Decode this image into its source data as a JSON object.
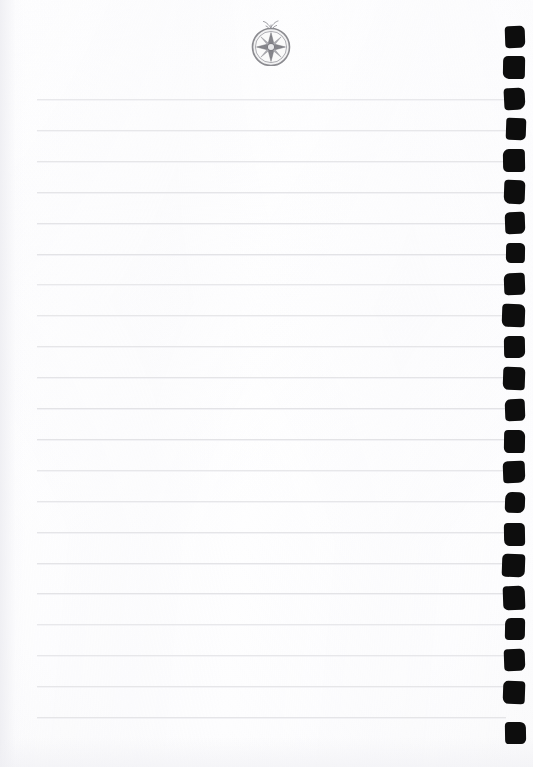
{
  "document": {
    "kind": "scanned-notebook-page",
    "title": "Blank lined notebook page",
    "page_text": "",
    "paper_color": "#fdfdfd",
    "rule_color": "#e3e3e6",
    "binding_color": "#0d0d0d",
    "emblem_color": "#8b8b90",
    "width": 533,
    "height": 767
  },
  "emblem": {
    "name": "compass-rose-emblem",
    "description": "eight-pointed compass rose medallion in a circle with a small stem flourish above",
    "label": "",
    "center_x": 271,
    "center_y": 44,
    "radius": 19,
    "points": 8,
    "stem": true
  },
  "rules": {
    "label": "ruled writing lines",
    "count": 21,
    "x_start": 37,
    "x_end": 506,
    "first_y": 99,
    "spacing": 30.9,
    "thickness": 1
  },
  "binding": {
    "label": "spiral binding punch holes",
    "count": 23,
    "first_y": 26,
    "spacing": 31.3,
    "x": 503,
    "width": 21,
    "height": 22,
    "holes": [
      {
        "x": 505,
        "y": 26,
        "w": 20,
        "h": 22,
        "r": "4px 5px 6px 4px",
        "rot": -2
      },
      {
        "x": 503,
        "y": 56,
        "w": 22,
        "h": 23,
        "r": "5px 4px 4px 6px",
        "rot": 1
      },
      {
        "x": 504,
        "y": 88,
        "w": 21,
        "h": 22,
        "r": "4px 6px 8px 4px",
        "rot": -3
      },
      {
        "x": 506,
        "y": 118,
        "w": 20,
        "h": 22,
        "r": "3px 4px 5px 4px",
        "rot": 2
      },
      {
        "x": 503,
        "y": 149,
        "w": 22,
        "h": 23,
        "r": "6px 4px 4px 5px",
        "rot": -1
      },
      {
        "x": 504,
        "y": 180,
        "w": 21,
        "h": 24,
        "r": "4px 5px 5px 7px",
        "rot": 2
      },
      {
        "x": 505,
        "y": 212,
        "w": 20,
        "h": 22,
        "r": "5px 4px 6px 4px",
        "rot": -2
      },
      {
        "x": 506,
        "y": 243,
        "w": 19,
        "h": 20,
        "r": "4px 5px 4px 5px",
        "rot": 1
      },
      {
        "x": 504,
        "y": 273,
        "w": 21,
        "h": 22,
        "r": "6px 4px 5px 4px",
        "rot": -2
      },
      {
        "x": 502,
        "y": 304,
        "w": 23,
        "h": 23,
        "r": "4px 6px 4px 6px",
        "rot": 2
      },
      {
        "x": 504,
        "y": 336,
        "w": 21,
        "h": 22,
        "r": "5px 4px 6px 4px",
        "rot": -1
      },
      {
        "x": 503,
        "y": 367,
        "w": 22,
        "h": 23,
        "r": "4px 5px 4px 6px",
        "rot": 2
      },
      {
        "x": 505,
        "y": 399,
        "w": 20,
        "h": 22,
        "r": "6px 4px 5px 4px",
        "rot": -2
      },
      {
        "x": 504,
        "y": 430,
        "w": 21,
        "h": 23,
        "r": "4px 6px 4px 5px",
        "rot": 1
      },
      {
        "x": 503,
        "y": 461,
        "w": 22,
        "h": 22,
        "r": "5px 4px 7px 4px",
        "rot": -2
      },
      {
        "x": 505,
        "y": 492,
        "w": 20,
        "h": 21,
        "r": "7px 6px 7px 5px",
        "rot": 2
      },
      {
        "x": 504,
        "y": 523,
        "w": 21,
        "h": 23,
        "r": "4px 5px 4px 6px",
        "rot": -1
      },
      {
        "x": 502,
        "y": 554,
        "w": 23,
        "h": 23,
        "r": "5px 4px 6px 4px",
        "rot": 2
      },
      {
        "x": 503,
        "y": 586,
        "w": 22,
        "h": 24,
        "r": "4px 6px 4px 5px",
        "rot": -2
      },
      {
        "x": 505,
        "y": 618,
        "w": 20,
        "h": 22,
        "r": "6px 4px 5px 4px",
        "rot": 1
      },
      {
        "x": 504,
        "y": 649,
        "w": 21,
        "h": 22,
        "r": "4px 5px 6px 4px",
        "rot": -2
      },
      {
        "x": 503,
        "y": 681,
        "w": 22,
        "h": 23,
        "r": "5px 4px 4px 6px",
        "rot": 2
      },
      {
        "x": 505,
        "y": 722,
        "w": 21,
        "h": 22,
        "r": "4px 6px 5px 4px",
        "rot": -1
      }
    ]
  }
}
